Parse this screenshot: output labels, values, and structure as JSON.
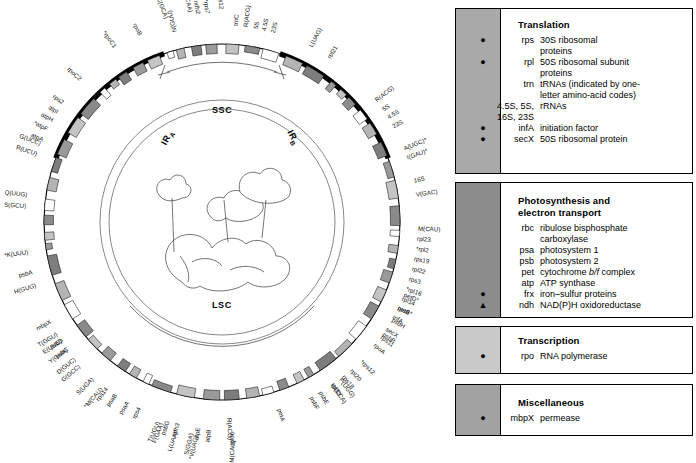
{
  "figure": {
    "type": "chloroplast-genome-map",
    "regions": [
      {
        "name": "SSC",
        "label": "SSC"
      },
      {
        "name": "IR-A",
        "label": "IR",
        "sub": "A"
      },
      {
        "name": "IR-B",
        "label": "IR",
        "sub": "B"
      },
      {
        "name": "LSC",
        "label": "LSC"
      }
    ],
    "gene_labels": [
      {
        "text": "N(GUU)",
        "angle": -104
      },
      {
        "text": "trnC",
        "angle": -86
      },
      {
        "text": "R(ACG)",
        "angle": -83
      },
      {
        "text": "5S",
        "angle": -80
      },
      {
        "text": "4.5S",
        "angle": -77.5
      },
      {
        "text": "23S",
        "angle": -75
      },
      {
        "text": "L(UAG)",
        "angle": -63
      },
      {
        "text": "rpl21",
        "angle": -57
      },
      {
        "text": "R(ACG)",
        "angle": -38
      },
      {
        "text": "5S",
        "angle": -35
      },
      {
        "text": "4.5S",
        "angle": -32
      },
      {
        "text": "23S",
        "angle": -29
      },
      {
        "text": "A(UGC)*",
        "angle": -22
      },
      {
        "text": "I(GAU)*",
        "angle": -19
      },
      {
        "text": "16S",
        "angle": -12
      },
      {
        "text": "V(GAC)",
        "angle": -8
      },
      {
        "text": "M(CAU)",
        "angle": 2
      },
      {
        "text": "rpl23",
        "angle": 5
      },
      {
        "text": "*rpl2",
        "angle": 8
      },
      {
        "text": "rps19",
        "angle": 11
      },
      {
        "text": "rpl22",
        "angle": 14
      },
      {
        "text": "rps3",
        "angle": 17
      },
      {
        "text": "*rpl16",
        "angle": 20
      },
      {
        "text": "rpl14",
        "angle": 23
      },
      {
        "text": "rps8",
        "angle": 26
      },
      {
        "text": "infA",
        "angle": 29
      },
      {
        "text": "secX",
        "angle": 33
      },
      {
        "text": "rps11",
        "angle": 36
      },
      {
        "text": "rpoA",
        "angle": 39
      },
      {
        "text": "petD*",
        "angle": 22
      },
      {
        "text": "petB*",
        "angle": 26
      },
      {
        "text": "psbH",
        "angle": 30
      },
      {
        "text": "psbB",
        "angle": 35
      },
      {
        "text": "*rps12",
        "angle": 45
      },
      {
        "text": "rpl20",
        "angle": 49
      },
      {
        "text": "P(UGG)",
        "angle": 53
      },
      {
        "text": "W(CCA)",
        "angle": 56
      },
      {
        "text": "psbE",
        "angle": 60
      },
      {
        "text": "psbF",
        "angle": 63
      },
      {
        "text": "rps18",
        "angle": 52
      },
      {
        "text": "rpl33",
        "angle": 56
      },
      {
        "text": "petA",
        "angle": 73
      },
      {
        "text": "R(ACG)",
        "angle": 88
      },
      {
        "text": "rpl36",
        "angle": 91
      },
      {
        "text": "atpB",
        "angle": 97
      },
      {
        "text": "atpE",
        "angle": 100
      },
      {
        "text": "*V(UAC)",
        "angle": 103
      },
      {
        "text": "ndh3",
        "angle": 106
      },
      {
        "text": "psbG",
        "angle": 109
      },
      {
        "text": "T(UGU)",
        "angle": 113
      },
      {
        "text": "rps4",
        "angle": 117
      },
      {
        "text": "S(GGA)",
        "angle": 104
      },
      {
        "text": "L(UAA)*",
        "angle": 108
      },
      {
        "text": "F(GAA)",
        "angle": 112
      },
      {
        "text": "M(CAU)",
        "angle": 93
      },
      {
        "text": "psaA",
        "angle": 121
      },
      {
        "text": "psaB",
        "angle": 125
      },
      {
        "text": "rps14",
        "angle": 128
      },
      {
        "text": "*M(CAU)",
        "angle": 131
      },
      {
        "text": "S(UGA)",
        "angle": 134
      },
      {
        "text": "G(GCC)",
        "angle": 139
      },
      {
        "text": "psbC",
        "angle": 143
      },
      {
        "text": "psbD",
        "angle": 146
      },
      {
        "text": "T(GGU)",
        "angle": 149
      },
      {
        "text": "mbpX",
        "angle": 152
      },
      {
        "text": "D(GUC)",
        "angle": 141
      },
      {
        "text": "Y(GUA)",
        "angle": 144
      },
      {
        "text": "E(UUC)",
        "angle": 147
      },
      {
        "text": "H(GUG)",
        "angle": 163
      },
      {
        "text": "psbA",
        "angle": 166
      },
      {
        "text": "*K(UUU)",
        "angle": 172
      },
      {
        "text": "S(GCU)",
        "angle": 184
      },
      {
        "text": "Q(UUG)",
        "angle": 187
      },
      {
        "text": "R(UCU)",
        "angle": 198
      },
      {
        "text": "G(UCC)",
        "angle": 201
      },
      {
        "text": "atpA",
        "angle": 203
      },
      {
        "text": "*atpF",
        "angle": 206
      },
      {
        "text": "atpH",
        "angle": 209
      },
      {
        "text": "atpI",
        "angle": 212
      },
      {
        "text": "rps2",
        "angle": 215
      },
      {
        "text": "rpoC2",
        "angle": 222
      },
      {
        "text": "*rpoC1",
        "angle": 234
      },
      {
        "text": "rpoB",
        "angle": 243
      },
      {
        "text": "C(GCA)",
        "angle": 249
      },
      {
        "text": "L(CAA)",
        "angle": 256
      },
      {
        "text": "*ndh2",
        "angle": 259
      },
      {
        "text": "*rps7",
        "angle": 262
      },
      {
        "text": "*rps12",
        "angle": 265
      }
    ]
  },
  "legend": {
    "groups": [
      {
        "id": "translation",
        "title": "Translation",
        "swatch_color": "#a9a9a9",
        "entries": [
          {
            "symbol": "●",
            "gene": "rps",
            "desc": "30S ribosomal",
            "cont": "proteins"
          },
          {
            "symbol": "●",
            "gene": "rpl",
            "desc": "50S ribosomal subunit",
            "cont": "proteins"
          },
          {
            "symbol": "",
            "gene": "trn",
            "desc": "tRNAs (indicated by one-",
            "cont": "letter amino-acid codes)"
          },
          {
            "symbol": "",
            "gene": "4.5S, 5S,",
            "gene2": "16S, 23S",
            "desc": "rRNAs",
            "cont": ""
          },
          {
            "symbol": "●",
            "gene": "infA",
            "desc": "initiation factor",
            "cont": ""
          },
          {
            "symbol": "●",
            "gene": "secX",
            "desc": "50S ribosomal protein",
            "cont": ""
          }
        ]
      },
      {
        "id": "photosynthesis",
        "title": "Photosynthesis and",
        "title2": "electron transport",
        "swatch_color": "#8c8c8c",
        "entries": [
          {
            "symbol": "",
            "gene": "rbc",
            "desc": "ribulose bisphosphate",
            "cont": "carboxylase"
          },
          {
            "symbol": "",
            "gene": "psa",
            "desc": "photosystem 1",
            "cont": ""
          },
          {
            "symbol": "",
            "gene": "psb",
            "desc": "photosystem 2",
            "cont": ""
          },
          {
            "symbol": "",
            "gene": "pet",
            "desc": "cytochrome b/f complex",
            "cont": ""
          },
          {
            "symbol": "",
            "gene": "atp",
            "desc": "ATP synthase",
            "cont": ""
          },
          {
            "symbol": "●",
            "gene": "frx",
            "desc": "iron–sulfur proteins",
            "cont": ""
          },
          {
            "symbol": "▲",
            "gene": "ndh",
            "desc": "NAD(P)H oxidoreductase",
            "cont": ""
          }
        ]
      },
      {
        "id": "transcription",
        "title": "Transcription",
        "swatch_color": "#c9c9c9",
        "entries": [
          {
            "symbol": "●",
            "gene": "rpo",
            "desc": "RNA polymerase",
            "cont": ""
          }
        ]
      },
      {
        "id": "miscellaneous",
        "title": "Miscellaneous",
        "swatch_color": "#a2a2a2",
        "entries": [
          {
            "symbol": "●",
            "gene": "mbpX",
            "desc": "permease",
            "cont": ""
          }
        ]
      }
    ]
  }
}
